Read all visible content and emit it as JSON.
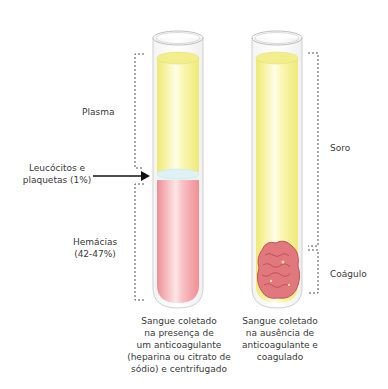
{
  "left_tube": {
    "labels": {
      "plasma": "Plasma",
      "buffy_coat_line1": "Leucócitos e",
      "buffy_coat_line2": "plaquetas (1%)",
      "rbc_line1": "Hemácias",
      "rbc_line2": "(42-47%)"
    },
    "caption": [
      "Sangue coletado",
      "na presença de",
      "um anticoagulante",
      "(heparina ou citrato de",
      "sódio) e centrifugado"
    ],
    "colors": {
      "plasma": "#f6f29a",
      "buffy_coat": "#dff1f4",
      "rbc": "#f4a9ad"
    }
  },
  "right_tube": {
    "labels": {
      "serum": "Soro",
      "clot": "Coágulo"
    },
    "caption": [
      "Sangue coletado",
      "na ausência de",
      "anticoagulante e",
      "coagulado"
    ],
    "colors": {
      "serum": "#f6f29a",
      "clot": "#d9646a"
    }
  }
}
